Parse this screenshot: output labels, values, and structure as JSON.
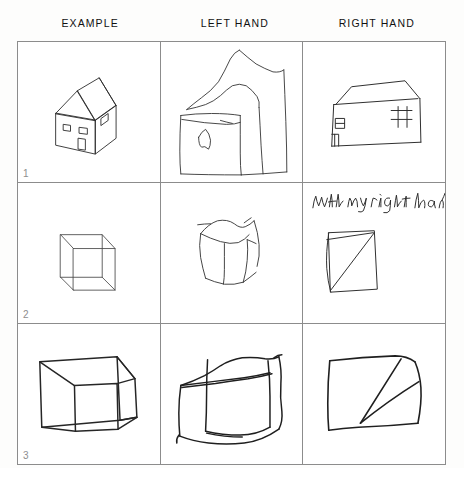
{
  "page": {
    "background_color": "#fdfdfc",
    "ink_color": "#1a1a1a",
    "grid_line_color": "#8c8c8c"
  },
  "headers": {
    "columns": [
      {
        "label": "EXAMPLE",
        "name": "column-header-example"
      },
      {
        "label": "LEFT HAND",
        "name": "column-header-left-hand"
      },
      {
        "label": "RIGHT HAND",
        "name": "column-header-right-hand"
      }
    ]
  },
  "rows": [
    {
      "number": "1",
      "task": "house",
      "cells": {
        "example": {
          "drawing": "house-3d-example",
          "description": "Neat 3D house with pitched roof, two windows and a door"
        },
        "left_hand": {
          "drawing": "house-left-hand-copy",
          "description": "Distorted wobbly house copy with tremor lines and a small door shape"
        },
        "right_hand": {
          "drawing": "house-right-hand-copy",
          "description": "Flattened house outline with roof and two window rectangles"
        }
      }
    },
    {
      "number": "2",
      "task": "cube",
      "cells": {
        "example": {
          "drawing": "cube-wireframe-example",
          "description": "Small transparent wireframe cube"
        },
        "left_hand": {
          "drawing": "cube-left-hand-copy",
          "description": "Crooked wobbly cube copy with overshooting lines"
        },
        "right_hand": {
          "drawing": "cube-right-hand-copy",
          "description": "Flat quadrilateral with single diagonal, no depth",
          "annotation": "With my right hand"
        }
      }
    },
    {
      "number": "3",
      "task": "cube-large",
      "cells": {
        "example": {
          "drawing": "cube-large-example",
          "description": "Larger bold wireframe cube"
        },
        "left_hand": {
          "drawing": "cube-large-left-hand-copy",
          "description": "Very shaky large cube with doubled tremor strokes"
        },
        "right_hand": {
          "drawing": "cube-large-right-hand-copy",
          "description": "Flat square with two converging diagonal lines"
        }
      }
    }
  ]
}
